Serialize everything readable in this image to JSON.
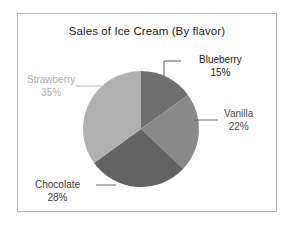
{
  "chart": {
    "title": "Sales of Ice Cream (By flavor)",
    "frame_border_color": "#b4b4b4",
    "background": "#ffffff"
  },
  "labels": {
    "blueberry": {
      "name": "Blueberry",
      "pct": "15%"
    },
    "vanilla": {
      "name": "Vanilla",
      "pct": "22%"
    },
    "chocolate": {
      "name": "Chocolate",
      "pct": "28%"
    },
    "strawberry": {
      "name": "Strawberry",
      "pct": "35%"
    }
  },
  "chart_data": {
    "type": "pie",
    "title": "Sales of Ice Cream (By flavor)",
    "xlabel": "",
    "ylabel": "",
    "categories": [
      "Blueberry",
      "Vanilla",
      "Chocolate",
      "Strawberry"
    ],
    "values": [
      15,
      22,
      28,
      35
    ],
    "value_labels": [
      "15%",
      "22%",
      "28%",
      "35%"
    ],
    "units": "percent",
    "total": 100,
    "start_angle_deg": 0,
    "direction": "clockwise",
    "legend": "none",
    "grid": false,
    "slice_colors": [
      "#6e6e6e",
      "#8a8a8a",
      "#636363",
      "#b0b0b0"
    ],
    "label_colors": [
      "#222222",
      "#4a4a4a",
      "#3c3c3c",
      "#adadad"
    ],
    "leader_lines": true,
    "slices": [
      {
        "label": "Blueberry",
        "value": 15,
        "display": "15%",
        "color": "#6e6e6e",
        "start_deg": 0,
        "end_deg": 54
      },
      {
        "label": "Vanilla",
        "value": 22,
        "display": "22%",
        "color": "#8a8a8a",
        "start_deg": 54,
        "end_deg": 133.2
      },
      {
        "label": "Chocolate",
        "value": 28,
        "display": "28%",
        "color": "#636363",
        "start_deg": 133.2,
        "end_deg": 234
      },
      {
        "label": "Strawberry",
        "value": 35,
        "display": "35%",
        "color": "#b0b0b0",
        "start_deg": 234,
        "end_deg": 360
      }
    ]
  }
}
